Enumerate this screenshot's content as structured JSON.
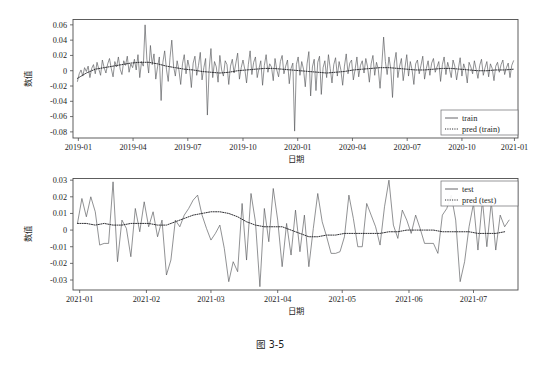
{
  "figure": {
    "caption": "图 3-5",
    "background": "#ffffff",
    "line_color": "#55565a",
    "pred_color": "#26262a"
  },
  "chart_data": [
    {
      "id": "train-panel",
      "type": "line",
      "title": "",
      "xlabel": "日期",
      "ylabel": "数值",
      "grid": false,
      "legend_position": "lower-right",
      "ylim": [
        -0.088,
        0.067
      ],
      "yticks": [
        0.06,
        0.04,
        0.02,
        0,
        -0.02,
        -0.04,
        -0.06,
        -0.08
      ],
      "ytick_labels": [
        "0.06",
        "0.04",
        "0.02",
        "0",
        "-0.02",
        "-0.04",
        "-0.06",
        "-0.08"
      ],
      "xlim": [
        0,
        100
      ],
      "xticks": [
        1.2,
        13.5,
        25.8,
        38.2,
        50.5,
        62.8,
        75.1,
        87.4,
        99.2
      ],
      "xtick_labels": [
        "2019-01",
        "2019-04",
        "2019-07",
        "2019-10",
        "2020-01",
        "2020-04",
        "2020-07",
        "2020-10",
        "2021-01"
      ],
      "series": [
        {
          "name": "train",
          "style": "solid",
          "x": [
            1.0,
            1.4,
            1.8,
            2.2,
            2.6,
            3.0,
            3.4,
            3.8,
            4.2,
            4.6,
            5.0,
            5.4,
            5.8,
            6.2,
            6.6,
            7.0,
            7.4,
            7.8,
            8.2,
            8.6,
            9.0,
            9.4,
            9.8,
            10.2,
            10.6,
            11.0,
            11.4,
            11.8,
            12.2,
            12.6,
            13.0,
            13.4,
            13.8,
            14.2,
            14.6,
            15.0,
            15.4,
            15.8,
            16.2,
            16.6,
            17.0,
            17.4,
            17.8,
            18.2,
            18.6,
            19.0,
            19.4,
            19.8,
            20.2,
            20.6,
            21.0,
            21.4,
            21.8,
            22.2,
            22.6,
            23.0,
            23.4,
            23.8,
            24.2,
            24.6,
            25.0,
            25.4,
            25.8,
            26.2,
            26.6,
            27.0,
            27.4,
            27.8,
            28.2,
            28.6,
            29.0,
            29.4,
            29.8,
            30.2,
            30.6,
            31.0,
            31.4,
            31.8,
            32.2,
            32.6,
            33.0,
            33.4,
            33.8,
            34.2,
            34.6,
            35.0,
            35.4,
            35.8,
            36.2,
            36.6,
            37.0,
            37.4,
            37.8,
            38.2,
            38.6,
            39.0,
            39.4,
            39.8,
            40.2,
            40.6,
            41.0,
            41.4,
            41.8,
            42.2,
            42.6,
            43.0,
            43.4,
            43.8,
            44.2,
            44.6,
            45.0,
            45.4,
            45.8,
            46.2,
            46.6,
            47.0,
            47.4,
            47.8,
            48.2,
            48.6,
            49.0,
            49.4,
            49.8,
            50.2,
            50.6,
            51.0,
            51.4,
            51.8,
            52.2,
            52.6,
            53.0,
            53.4,
            53.8,
            54.2,
            54.6,
            55.0,
            55.4,
            55.8,
            56.2,
            56.6,
            57.0,
            57.4,
            57.8,
            58.2,
            58.6,
            59.0,
            59.4,
            59.8,
            60.2,
            60.6,
            61.0,
            61.4,
            61.8,
            62.2,
            62.6,
            63.0,
            63.4,
            63.8,
            64.2,
            64.6,
            65.0,
            65.4,
            65.8,
            66.2,
            66.6,
            67.0,
            67.4,
            67.8,
            68.2,
            68.6,
            69.0,
            69.4,
            69.8,
            70.2,
            70.6,
            71.0,
            71.4,
            71.8,
            72.2,
            72.6,
            73.0,
            73.4,
            73.8,
            74.2,
            74.6,
            75.0,
            75.4,
            75.8,
            76.2,
            76.6,
            77.0,
            77.4,
            77.8,
            78.2,
            78.6,
            79.0,
            79.4,
            79.8,
            80.2,
            80.6,
            81.0,
            81.4,
            81.8,
            82.2,
            82.6,
            83.0,
            83.4,
            83.8,
            84.2,
            84.6,
            85.0,
            85.4,
            85.8,
            86.2,
            86.6,
            87.0,
            87.4,
            87.8,
            88.2,
            88.6,
            89.0,
            89.4,
            89.8,
            90.2,
            90.6,
            91.0,
            91.4,
            91.8,
            92.2,
            92.6,
            93.0,
            93.4,
            93.8,
            94.2,
            94.6,
            95.0,
            95.4,
            95.8,
            96.2,
            96.6,
            97.0,
            97.4,
            97.8,
            98.2,
            98.6,
            99.0
          ],
          "y": [
            -0.014,
            -0.004,
            0.001,
            -0.007,
            0.004,
            -0.001,
            0.006,
            -0.009,
            0.003,
            0.008,
            -0.004,
            0.011,
            0.002,
            -0.006,
            0.014,
            0.004,
            -0.003,
            0.009,
            0.016,
            0.003,
            -0.008,
            0.012,
            0.005,
            0.018,
            0.002,
            -0.005,
            0.013,
            0.007,
            0.019,
            -0.002,
            0.009,
            0.004,
            0.015,
            0.001,
            0.021,
            -0.009,
            0.012,
            0.006,
            0.06,
            0.015,
            -0.003,
            0.033,
            0.008,
            0.022,
            -0.011,
            0.005,
            0.018,
            -0.039,
            0.011,
            0.026,
            0.002,
            -0.014,
            0.017,
            0.04,
            0.006,
            -0.007,
            0.013,
            0.001,
            -0.018,
            0.009,
            0.021,
            -0.004,
            0.014,
            0.003,
            -0.022,
            0.01,
            0.019,
            -0.006,
            0.007,
            0.024,
            -0.012,
            0.004,
            0.016,
            -0.058,
            0.002,
            0.029,
            -0.009,
            0.012,
            0.005,
            -0.015,
            0.02,
            0.001,
            -0.007,
            0.013,
            0.008,
            -0.018,
            0.006,
            0.015,
            -0.003,
            0.01,
            0.023,
            -0.011,
            0.004,
            0.014,
            0.002,
            -0.016,
            0.008,
            0.026,
            -0.005,
            0.011,
            0.018,
            -0.009,
            0.003,
            0.013,
            -0.019,
            0.007,
            0.021,
            -0.002,
            0.009,
            0.005,
            -0.013,
            0.016,
            0.001,
            -0.008,
            0.012,
            0.02,
            -0.004,
            0.006,
            0.014,
            -0.017,
            0.003,
            0.01,
            -0.079,
            0.008,
            0.018,
            -0.006,
            0.012,
            0.002,
            -0.021,
            0.009,
            0.025,
            -0.033,
            0.005,
            0.015,
            -0.026,
            0.011,
            0.019,
            -0.031,
            0.004,
            0.013,
            -0.009,
            0.021,
            0.003,
            -0.016,
            0.008,
            0.017,
            -0.007,
            0.012,
            0.001,
            -0.019,
            0.006,
            0.022,
            -0.004,
            0.01,
            0.014,
            -0.012,
            0.002,
            0.018,
            -0.008,
            0.007,
            0.013,
            -0.003,
            0.016,
            0.005,
            -0.015,
            0.009,
            0.02,
            -0.006,
            0.011,
            0.002,
            -0.023,
            0.008,
            0.044,
            0.012,
            -0.005,
            0.018,
            0.003,
            -0.035,
            0.01,
            0.024,
            -0.009,
            0.006,
            0.016,
            -0.013,
            0.004,
            0.021,
            -0.007,
            0.012,
            0.001,
            -0.018,
            0.009,
            0.014,
            -0.004,
            0.007,
            0.019,
            -0.011,
            0.003,
            0.013,
            -0.006,
            0.01,
            0.016,
            -0.002,
            0.005,
            0.012,
            -0.014,
            0.008,
            0.018,
            -0.005,
            0.011,
            0.002,
            -0.009,
            0.014,
            0.006,
            -0.012,
            0.003,
            0.017,
            -0.007,
            0.009,
            0.001,
            -0.016,
            0.011,
            0.005,
            -0.004,
            0.013,
            0.002,
            -0.01,
            0.007,
            0.015,
            -0.006,
            0.004,
            0.012,
            -0.008,
            0.009,
            0.003,
            -0.013,
            0.006,
            0.011,
            -0.002,
            0.008,
            0.014,
            -0.005,
            0.004,
            0.01,
            -0.009,
            0.007,
            0.013,
            -0.003,
            0.005,
            0.011,
            -0.007,
            0.009,
            0.002,
            0.016
          ]
        },
        {
          "name": "pred (train)",
          "style": "dotted",
          "x": [
            1.0,
            3.0,
            5.0,
            7.0,
            9.0,
            11.0,
            13.0,
            15.0,
            17.0,
            19.0,
            21.0,
            23.0,
            25.0,
            27.0,
            29.0,
            31.0,
            33.0,
            35.0,
            37.0,
            39.0,
            41.0,
            43.0,
            45.0,
            47.0,
            49.0,
            51.0,
            53.0,
            55.0,
            57.0,
            59.0,
            61.0,
            63.0,
            65.0,
            67.0,
            69.0,
            71.0,
            73.0,
            75.0,
            77.0,
            79.0,
            81.0,
            83.0,
            85.0,
            87.0,
            89.0,
            91.0,
            93.0,
            95.0,
            97.0,
            99.0
          ],
          "y": [
            -0.01,
            -0.003,
            0.002,
            0.004,
            0.006,
            0.008,
            0.01,
            0.011,
            0.011,
            0.009,
            0.006,
            0.004,
            0.002,
            0.001,
            -0.001,
            -0.002,
            -0.003,
            -0.002,
            0.0,
            0.001,
            0.002,
            0.003,
            0.003,
            0.002,
            0.001,
            0.0,
            -0.001,
            -0.002,
            -0.003,
            -0.002,
            -0.001,
            0.001,
            0.002,
            0.003,
            0.004,
            0.004,
            0.003,
            0.002,
            0.001,
            0.001,
            0.002,
            0.003,
            0.003,
            0.002,
            0.001,
            0.0,
            0.0,
            0.001,
            0.001,
            0.002
          ]
        }
      ]
    },
    {
      "id": "test-panel",
      "type": "line",
      "title": "",
      "xlabel": "日期",
      "ylabel": "数值",
      "grid": false,
      "legend_position": "upper-right",
      "ylim": [
        -0.036,
        0.031
      ],
      "yticks": [
        0.03,
        0.02,
        0.01,
        0,
        -0.01,
        -0.02,
        -0.03
      ],
      "ytick_labels": [
        "0.03",
        "0.02",
        "0.01",
        "0",
        "-0.01",
        "-0.02",
        "-0.03"
      ],
      "xlim": [
        0,
        100
      ],
      "xticks": [
        1.5,
        16.5,
        31.0,
        46.0,
        60.5,
        75.5,
        90.0
      ],
      "xtick_labels": [
        "2021-01",
        "2021-02",
        "2021-03",
        "2021-04",
        "2021-05",
        "2021-06",
        "2021-07"
      ],
      "series": [
        {
          "name": "test",
          "style": "solid",
          "x": [
            1.0,
            2.0,
            3.0,
            4.0,
            5.0,
            6.0,
            7.0,
            8.0,
            9.0,
            10.0,
            11.0,
            12.0,
            13.0,
            14.0,
            15.0,
            16.0,
            17.0,
            18.0,
            19.0,
            20.0,
            21.0,
            22.0,
            23.0,
            24.0,
            25.0,
            26.0,
            27.0,
            28.0,
            29.0,
            30.0,
            31.0,
            32.0,
            33.0,
            34.0,
            35.0,
            36.0,
            37.0,
            38.0,
            39.0,
            40.0,
            41.0,
            42.0,
            43.0,
            44.0,
            45.0,
            46.0,
            47.0,
            48.0,
            49.0,
            50.0,
            51.0,
            52.0,
            53.0,
            54.0,
            55.0,
            56.0,
            57.0,
            58.0,
            59.0,
            60.0,
            61.0,
            62.0,
            63.0,
            64.0,
            65.0,
            66.0,
            67.0,
            68.0,
            69.0,
            70.0,
            71.0,
            72.0,
            73.0,
            74.0,
            75.0,
            76.0,
            77.0,
            78.0,
            79.0,
            80.0,
            81.0,
            82.0,
            83.0,
            84.0,
            85.0,
            86.0,
            87.0,
            88.0,
            89.0,
            90.0,
            91.0,
            92.0,
            93.0,
            94.0,
            95.0,
            96.0,
            97.0,
            98.0
          ],
          "y": [
            0.004,
            0.019,
            0.008,
            0.02,
            0.011,
            -0.009,
            -0.008,
            -0.008,
            0.029,
            -0.019,
            0.006,
            0.001,
            -0.016,
            0.013,
            -0.001,
            0.017,
            0.002,
            0.011,
            -0.004,
            0.006,
            -0.027,
            -0.018,
            0.006,
            0.002,
            0.009,
            0.013,
            0.018,
            0.021,
            0.009,
            0.001,
            -0.006,
            -0.002,
            0.003,
            -0.011,
            -0.031,
            -0.019,
            -0.025,
            0.016,
            -0.018,
            0.022,
            0.005,
            -0.034,
            0.013,
            -0.007,
            0.025,
            0.006,
            -0.022,
            0.004,
            -0.015,
            0.012,
            -0.013,
            0.009,
            -0.022,
            0.001,
            0.022,
            0.005,
            -0.004,
            -0.014,
            -0.014,
            -0.013,
            -0.004,
            0.021,
            0.007,
            -0.01,
            -0.01,
            0.016,
            0.009,
            0.002,
            -0.009,
            0.014,
            0.03,
            0.003,
            -0.005,
            0.012,
            0.006,
            -0.002,
            0.009,
            0.001,
            -0.008,
            -0.008,
            -0.008,
            -0.014,
            0.009,
            0.013,
            0.021,
            0.006,
            -0.031,
            -0.019,
            0.002,
            0.016,
            -0.012,
            0.018,
            -0.01,
            0.017,
            -0.012,
            0.009,
            0.002,
            0.006
          ]
        },
        {
          "name": "pred (test)",
          "style": "dotted",
          "x": [
            1.0,
            3.0,
            5.0,
            7.0,
            9.0,
            11.0,
            13.0,
            15.0,
            17.0,
            19.0,
            21.0,
            23.0,
            25.0,
            27.0,
            29.0,
            31.0,
            33.0,
            35.0,
            37.0,
            39.0,
            41.0,
            43.0,
            45.0,
            47.0,
            49.0,
            51.0,
            53.0,
            55.0,
            57.0,
            59.0,
            61.0,
            63.0,
            65.0,
            67.0,
            69.0,
            71.0,
            73.0,
            75.0,
            77.0,
            79.0,
            81.0,
            83.0,
            85.0,
            87.0,
            89.0,
            91.0,
            93.0,
            95.0,
            97.0
          ],
          "y": [
            0.004,
            0.004,
            0.003,
            0.004,
            0.003,
            0.003,
            0.004,
            0.004,
            0.004,
            0.003,
            0.003,
            0.005,
            0.007,
            0.009,
            0.01,
            0.011,
            0.011,
            0.01,
            0.008,
            0.005,
            0.003,
            0.002,
            0.002,
            0.002,
            0.0,
            -0.002,
            -0.004,
            -0.004,
            -0.003,
            -0.003,
            -0.002,
            -0.002,
            -0.002,
            -0.002,
            -0.002,
            -0.001,
            -0.001,
            0.0,
            0.0,
            0.0,
            0.0,
            -0.001,
            -0.001,
            -0.001,
            -0.001,
            -0.002,
            -0.002,
            -0.002,
            -0.001
          ]
        }
      ]
    }
  ],
  "panels": [
    {
      "legend": [
        {
          "label": "train",
          "style": "solid"
        },
        {
          "label": "pred (train)",
          "style": "dotted"
        }
      ]
    },
    {
      "legend": [
        {
          "label": "test",
          "style": "solid"
        },
        {
          "label": "pred (test)",
          "style": "dotted"
        }
      ]
    }
  ]
}
